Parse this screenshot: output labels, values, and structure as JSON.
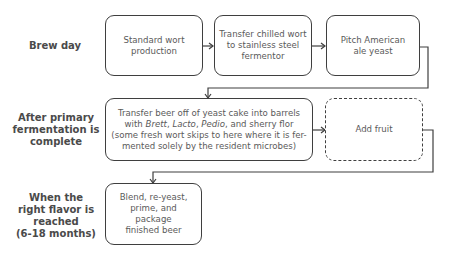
{
  "rows": [
    {
      "label_lines": [
        "Brew day"
      ]
    },
    {
      "label_lines": [
        "After primary",
        "fermentation is",
        "complete"
      ]
    },
    {
      "label_lines": [
        "When the",
        "right flavor is",
        "reached",
        "(6-18 months)"
      ]
    }
  ],
  "steps": {
    "standard_wort": {
      "lines": [
        "Standard wort",
        "production"
      ]
    },
    "transfer_chilled": {
      "lines": [
        "Transfer chilled wort",
        "to stainless steel",
        "fermentor"
      ]
    },
    "pitch_yeast": {
      "lines": [
        "Pitch American",
        "ale yeast"
      ]
    },
    "transfer_barrels": {
      "line1": "Transfer beer off of yeast cake into barrels",
      "line2_prefix": "with ",
      "brett": "Brett",
      "sep1": ", ",
      "lacto": "Lacto",
      "sep2": ", ",
      "pedio": "Pedio",
      "line2_suffix": ", and sherry flor",
      "line3": "(some fresh wort skips to here where it is fer-",
      "line4": "mented solely by the resident microbes)"
    },
    "add_fruit": {
      "lines": [
        "Add fruit"
      ],
      "style": "dashed"
    },
    "blend": {
      "lines": [
        "Blend, re-yeast,",
        "prime, and",
        "package",
        "finished beer"
      ]
    }
  },
  "colors": {
    "stroke": "#3f3f3f",
    "text": "#5a5a5a",
    "label": "#4a4a4a"
  }
}
